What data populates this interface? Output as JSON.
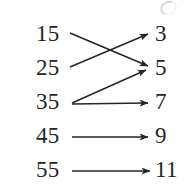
{
  "figure": {
    "type": "mapping-diagram",
    "background_color": "#ffffff",
    "ink_color": "#262626"
  },
  "chart_data": {
    "type": "diagram",
    "title": "",
    "xlabel": "",
    "ylabel": "",
    "domain": [
      "15",
      "25",
      "35",
      "45",
      "55"
    ],
    "codomain": [
      "3",
      "5",
      "7",
      "9",
      "11"
    ],
    "mappings": [
      {
        "from": "15",
        "to": "5"
      },
      {
        "from": "25",
        "to": "3"
      },
      {
        "from": "35",
        "to": "5"
      },
      {
        "from": "35",
        "to": "7"
      },
      {
        "from": "45",
        "to": "9"
      },
      {
        "from": "55",
        "to": "11"
      }
    ]
  },
  "left_column": {
    "items": [
      {
        "value": "15",
        "x": 36,
        "y": 22
      },
      {
        "value": "25",
        "x": 36,
        "y": 56
      },
      {
        "value": "35",
        "x": 36,
        "y": 90
      },
      {
        "value": "45",
        "x": 36,
        "y": 124
      },
      {
        "value": "55",
        "x": 36,
        "y": 158
      }
    ]
  },
  "right_column": {
    "items": [
      {
        "value": "3",
        "x": 155,
        "y": 22
      },
      {
        "value": "5",
        "x": 155,
        "y": 56
      },
      {
        "value": "7",
        "x": 155,
        "y": 90
      },
      {
        "value": "9",
        "x": 155,
        "y": 124
      },
      {
        "value": "11",
        "x": 155,
        "y": 158
      }
    ]
  },
  "arrows": [
    {
      "name": "arrow-15-to-5",
      "x1": 70,
      "y1": 33,
      "x2": 148,
      "y2": 66
    },
    {
      "name": "arrow-25-to-3",
      "x1": 70,
      "y1": 67,
      "x2": 148,
      "y2": 34
    },
    {
      "name": "arrow-35-to-5",
      "x1": 72,
      "y1": 103,
      "x2": 146,
      "y2": 70
    },
    {
      "name": "arrow-35-to-7",
      "x1": 72,
      "y1": 104,
      "x2": 148,
      "y2": 103
    },
    {
      "name": "arrow-45-to-9",
      "x1": 72,
      "y1": 137,
      "x2": 148,
      "y2": 137
    },
    {
      "name": "arrow-55-to-11",
      "x1": 72,
      "y1": 171,
      "x2": 150,
      "y2": 171
    }
  ]
}
